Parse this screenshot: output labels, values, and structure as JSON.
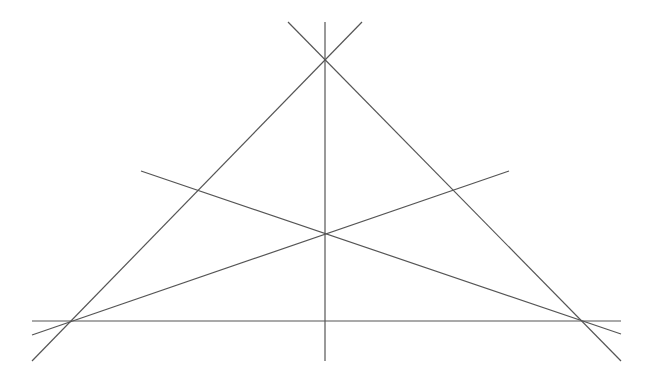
{
  "diagram": {
    "title": "",
    "stroke_color": "#555555",
    "background": "#ffffff",
    "vertices": {
      "apex": [
        325,
        61
      ],
      "left": [
        70,
        321
      ],
      "right": [
        579,
        321
      ],
      "centroid": [
        325,
        234
      ]
    },
    "lines": [
      {
        "name": "base-line",
        "x1": 32,
        "y1": 321,
        "x2": 621,
        "y2": 321
      },
      {
        "name": "left-side-line",
        "x1": 32,
        "y1": 361,
        "x2": 362,
        "y2": 22
      },
      {
        "name": "right-side-line",
        "x1": 288,
        "y1": 22,
        "x2": 621,
        "y2": 361
      },
      {
        "name": "vertical-median-line",
        "x1": 325,
        "y1": 22,
        "x2": 325,
        "y2": 361
      },
      {
        "name": "median-from-left-line",
        "x1": 32,
        "y1": 335,
        "x2": 509,
        "y2": 171
      },
      {
        "name": "median-from-right-line",
        "x1": 141,
        "y1": 171,
        "x2": 621,
        "y2": 334
      }
    ]
  }
}
